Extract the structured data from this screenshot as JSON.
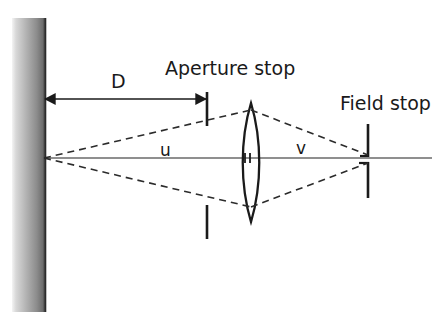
{
  "figure": {
    "background_color": "#ffffff",
    "line_color": "#1a1a1a",
    "axis_color": "#555555",
    "object_bar": {
      "name": "object-plane-bar",
      "gradient_light": "#f2f2f2",
      "gradient_mid": "#9a9a9a",
      "gradient_dark": "#6f6f6f",
      "edge_color": "#3a3a3a",
      "x": 12,
      "y": 18,
      "width": 33,
      "height": 294
    }
  },
  "labels": {
    "aperture_stop": "Aperture stop",
    "field_stop": "Field stop",
    "distance_d": "D",
    "object_distance_u": "u",
    "image_distance_v": "v"
  },
  "geometry": {
    "optical_axis_y": 158,
    "axis_start_x": 44,
    "axis_end_x": 432,
    "dimension_arrow": {
      "name": "distance-d-arrow",
      "y": 99,
      "x_start": 44,
      "x_end": 207
    },
    "aperture_stop": {
      "x": 207,
      "upper_bar_y_top": 92,
      "upper_bar_y_bottom": 126,
      "lower_bar_y_top": 205,
      "lower_bar_y_bottom": 239
    },
    "lens": {
      "name": "biconvex-lens",
      "center_x": 251,
      "top_y": 103,
      "bottom_y": 222,
      "half_width": 12,
      "center_tick_left_x": 245,
      "center_tick_right_x": 256,
      "center_tick_half_height": 5
    },
    "field_stop": {
      "x": 368,
      "upper_bar_y_top": 124,
      "upper_bar_y_bottom": 157,
      "lower_bar_y_top": 162,
      "lower_bar_y_bottom": 198
    },
    "rays": {
      "source_point": [
        44,
        158
      ],
      "lens_top_point": [
        251,
        110
      ],
      "lens_bottom_point": [
        251,
        207
      ],
      "image_top_point": [
        368,
        155
      ],
      "image_bottom_point": [
        368,
        163
      ],
      "dash_pattern": "7,5"
    }
  }
}
